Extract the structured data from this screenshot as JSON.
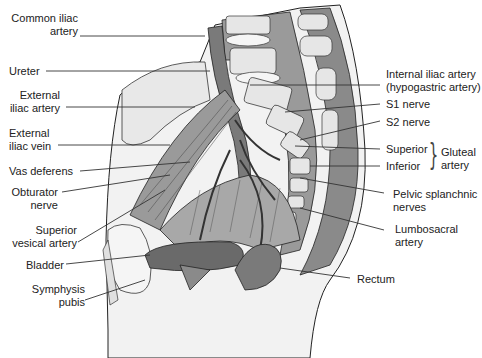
{
  "figure": {
    "type": "anatomical illustration",
    "colors": {
      "background": "#ffffff",
      "skin": "#f2f2f2",
      "tissue_dark": "#8a8a8a",
      "tissue_mid": "#a8a8a8",
      "bone": "#e6e6e6",
      "outline": "#222222",
      "leader": "#333333"
    }
  },
  "labels_left": [
    {
      "id": "common-iliac-artery",
      "lines": [
        "Common iliac",
        "artery"
      ]
    },
    {
      "id": "ureter",
      "lines": [
        "Ureter"
      ]
    },
    {
      "id": "external-iliac-artery",
      "lines": [
        "External",
        "iliac artery"
      ]
    },
    {
      "id": "external-iliac-vein",
      "lines": [
        "External",
        "iliac vein"
      ]
    },
    {
      "id": "vas-deferens",
      "lines": [
        "Vas deferens"
      ]
    },
    {
      "id": "obturator-nerve",
      "lines": [
        "Obturator",
        "nerve"
      ]
    },
    {
      "id": "superior-vesical-artery",
      "lines": [
        "Superior",
        "vesical artery"
      ]
    },
    {
      "id": "bladder",
      "lines": [
        "Bladder"
      ]
    },
    {
      "id": "symphysis-pubis",
      "lines": [
        "Symphysis",
        "pubis"
      ]
    }
  ],
  "labels_right": [
    {
      "id": "internal-iliac-artery",
      "lines": [
        "Internal iliac artery",
        "(hypogastric artery)"
      ]
    },
    {
      "id": "s1-nerve",
      "lines": [
        "S1 nerve"
      ]
    },
    {
      "id": "s2-nerve",
      "lines": [
        "S2 nerve"
      ]
    },
    {
      "id": "gluteal-superior",
      "lines": [
        "Superior"
      ]
    },
    {
      "id": "gluteal-inferior",
      "lines": [
        "Inferior"
      ]
    },
    {
      "id": "gluteal-artery-group",
      "lines": [
        "Gluteal",
        "artery"
      ]
    },
    {
      "id": "pelvic-splanchnic-nerves",
      "lines": [
        "Pelvic splanchnic",
        "nerves"
      ]
    },
    {
      "id": "lumbosacral-artery",
      "lines": [
        "Lumbosacral",
        "artery"
      ]
    },
    {
      "id": "rectum",
      "lines": [
        "Rectum"
      ]
    }
  ]
}
